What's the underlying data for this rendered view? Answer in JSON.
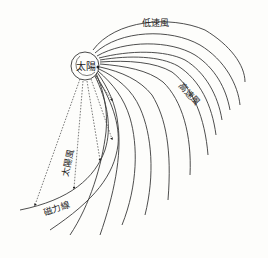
{
  "diagram": {
    "labels": {
      "sun": "太陽",
      "slow_wind": "低速風",
      "fast_wind": "高速風",
      "solar_wind": "太陽風",
      "field_line": "磁力線"
    },
    "colors": {
      "line": "#3a3a3a",
      "background": "#fdfdfb"
    }
  }
}
